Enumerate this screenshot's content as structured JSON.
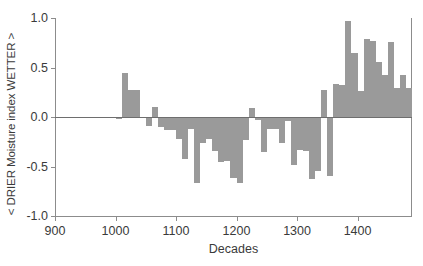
{
  "chart_data": {
    "type": "bar",
    "title": "",
    "subtitle": "",
    "xlabel": "Decades",
    "ylabel": "< DRIER Moisture index WETTER >",
    "xlim": [
      900,
      1490
    ],
    "ylim": [
      -1.0,
      1.0
    ],
    "xticks": [
      900,
      1000,
      1100,
      1200,
      1300,
      1400
    ],
    "xtick_labels": [
      "900",
      "1000",
      "1100",
      "1200",
      "1300",
      "1400"
    ],
    "yticks": [
      -1.0,
      -0.5,
      0.0,
      0.5,
      1.0
    ],
    "ytick_labels": [
      "-1.0",
      "-0.5",
      "0.0",
      "0.5",
      "1.0"
    ],
    "grid": false,
    "legend": null,
    "bar_color": "#9a9a9a",
    "axis_color": "#8c8c8c",
    "zero_line": 0.0,
    "bar_width_years": 10,
    "categories": [
      1000,
      1010,
      1020,
      1030,
      1040,
      1050,
      1060,
      1070,
      1080,
      1090,
      1100,
      1110,
      1120,
      1130,
      1140,
      1150,
      1160,
      1170,
      1180,
      1190,
      1200,
      1210,
      1220,
      1230,
      1240,
      1250,
      1260,
      1270,
      1280,
      1290,
      1300,
      1310,
      1320,
      1330,
      1340,
      1350,
      1360,
      1370,
      1380,
      1390,
      1400,
      1410,
      1420,
      1430,
      1440,
      1450,
      1460,
      1470,
      1480
    ],
    "values": [
      -0.02,
      0.44,
      0.27,
      0.27,
      0.0,
      -0.09,
      0.1,
      -0.1,
      -0.13,
      -0.13,
      -0.22,
      -0.42,
      -0.12,
      -0.67,
      -0.26,
      -0.22,
      -0.34,
      -0.45,
      -0.44,
      -0.62,
      -0.67,
      -0.23,
      0.09,
      -0.03,
      -0.35,
      -0.12,
      -0.12,
      -0.26,
      -0.04,
      -0.48,
      -0.33,
      -0.34,
      -0.63,
      -0.55,
      0.27,
      -0.6,
      0.33,
      0.32,
      0.97,
      0.65,
      0.26,
      0.79,
      0.77,
      0.56,
      0.42,
      0.76,
      0.29,
      0.42,
      0.29
    ],
    "series_name": "DRIER Moisture index"
  }
}
